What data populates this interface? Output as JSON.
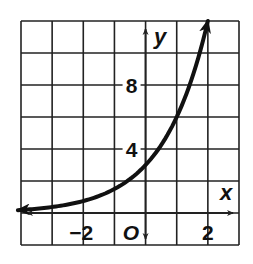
{
  "chart_data": {
    "type": "line",
    "title": "",
    "xlabel": "x",
    "ylabel": "y",
    "origin_label": "O",
    "xlim": [
      -4,
      3
    ],
    "ylim": [
      -2,
      12
    ],
    "x_grid_step": 1,
    "y_grid_step": 2,
    "grid": true,
    "x_tick_labels": [
      {
        "value": -2,
        "label": "−2"
      },
      {
        "value": 2,
        "label": "2"
      }
    ],
    "y_tick_labels": [
      {
        "value": 4,
        "label": "4"
      },
      {
        "value": 8,
        "label": "8"
      }
    ],
    "series": [
      {
        "name": "y = 3·2^x",
        "function": "3*2^x",
        "x": [
          -4,
          -3,
          -2,
          -1,
          0,
          1,
          2
        ],
        "y": [
          0.1875,
          0.375,
          0.75,
          1.5,
          3,
          6,
          12
        ],
        "arrows": "both-ends"
      }
    ],
    "colors": {
      "grid": "#222222",
      "curve": "#111111",
      "background": "#ffffff"
    }
  }
}
